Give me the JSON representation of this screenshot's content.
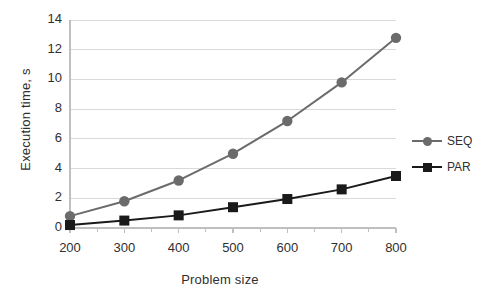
{
  "chart_data": {
    "type": "line",
    "title": "",
    "xlabel": "Problem size",
    "ylabel": "Execution time, s",
    "categories": [
      "200",
      "300",
      "400",
      "500",
      "600",
      "700",
      "800"
    ],
    "xlim": [
      200,
      800
    ],
    "ylim": [
      0,
      14
    ],
    "yticks": [
      "0",
      "2",
      "4",
      "6",
      "8",
      "10",
      "12",
      "14"
    ],
    "ytick_values": [
      0,
      2,
      4,
      6,
      8,
      10,
      12,
      14
    ],
    "grid": "horizontal",
    "legend_position": "right",
    "series": [
      {
        "name": "SEQ",
        "values": [
          0.8,
          1.8,
          3.2,
          5.0,
          7.2,
          9.8,
          12.8
        ],
        "color": "#6b6b6b",
        "marker": "circle"
      },
      {
        "name": "PAR",
        "values": [
          0.2,
          0.5,
          0.85,
          1.4,
          1.95,
          2.6,
          3.5
        ],
        "color": "#1a1a1a",
        "marker": "square"
      }
    ]
  },
  "legend": {
    "items": [
      {
        "label": "SEQ"
      },
      {
        "label": "PAR"
      }
    ]
  },
  "colors": {
    "seq": "#6b6b6b",
    "par": "#1a1a1a",
    "grid": "#d9d9d9",
    "axis": "#bfbfbf",
    "text": "#2f2f2f",
    "background": "#ffffff"
  }
}
